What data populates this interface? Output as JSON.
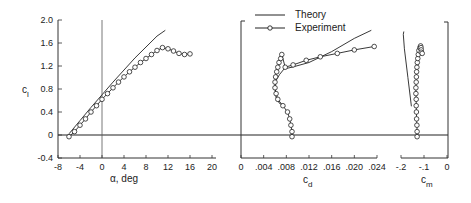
{
  "chart_data": [
    {
      "type": "line",
      "title": "",
      "xlabel": "α, deg",
      "ylabel": "c_l",
      "xlim": [
        -8,
        20
      ],
      "ylim": [
        -0.4,
        2.0
      ],
      "xticks": [
        "-8",
        "-4",
        "0",
        "4",
        "8",
        "12",
        "16",
        "20"
      ],
      "yticks": [
        "-0.4",
        "0",
        "0.4",
        "0.8",
        "1.2",
        "1.6",
        "2.0"
      ],
      "grid": false,
      "series": [
        {
          "name": "Theory",
          "style": "solid line",
          "x": [
            -6,
            -4,
            -2,
            0,
            2,
            4,
            6,
            8,
            10,
            11.5
          ],
          "y": [
            0.02,
            0.25,
            0.48,
            0.7,
            0.92,
            1.13,
            1.34,
            1.53,
            1.72,
            1.82
          ]
        },
        {
          "name": "Experiment",
          "style": "line with open circles",
          "x": [
            -6,
            -5,
            -4,
            -3,
            -2,
            -1,
            0,
            1,
            2,
            3,
            4,
            5,
            6,
            7,
            8,
            9,
            10,
            11,
            12,
            13,
            14,
            15,
            16
          ],
          "y": [
            -0.03,
            0.06,
            0.17,
            0.28,
            0.4,
            0.51,
            0.62,
            0.72,
            0.82,
            0.92,
            1.01,
            1.1,
            1.18,
            1.26,
            1.33,
            1.4,
            1.47,
            1.52,
            1.5,
            1.46,
            1.42,
            1.4,
            1.41
          ]
        }
      ]
    },
    {
      "type": "line",
      "title": "",
      "xlabel": "c_d",
      "ylabel": "",
      "xlim": [
        0,
        0.024
      ],
      "ylim": [
        -0.4,
        2.0
      ],
      "xticks": [
        "0",
        ".004",
        ".008",
        ".012",
        ".016",
        ".020",
        ".024"
      ],
      "grid": false,
      "series": [
        {
          "name": "Theory",
          "style": "solid line",
          "x": [
            0.0078,
            0.0068,
            0.0062,
            0.006,
            0.0062,
            0.0068,
            0.0076,
            0.009,
            0.012,
            0.016,
            0.02,
            0.023
          ],
          "y": [
            0.5,
            0.55,
            0.65,
            0.8,
            0.95,
            1.05,
            1.15,
            1.18,
            1.26,
            1.45,
            1.68,
            1.82
          ]
        },
        {
          "name": "Experiment",
          "style": "line with open circles",
          "x": [
            0.009,
            0.009,
            0.0088,
            0.0086,
            0.0082,
            0.0074,
            0.0065,
            0.0062,
            0.006,
            0.006,
            0.0061,
            0.0063,
            0.0065,
            0.0067,
            0.007,
            0.0072,
            0.0078,
            0.0092,
            0.0115,
            0.014,
            0.017,
            0.02,
            0.0235
          ],
          "y": [
            -0.03,
            0.06,
            0.17,
            0.28,
            0.4,
            0.51,
            0.62,
            0.72,
            0.82,
            0.92,
            1.01,
            1.1,
            1.18,
            1.26,
            1.33,
            1.4,
            1.18,
            1.22,
            1.3,
            1.36,
            1.42,
            1.48,
            1.54
          ]
        }
      ]
    },
    {
      "type": "line",
      "title": "",
      "xlabel": "c_m",
      "ylabel": "",
      "xlim": [
        -0.2,
        0
      ],
      "ylim": [
        -0.4,
        2.0
      ],
      "xticks": [
        "-.2",
        "-.1",
        "0"
      ],
      "grid": false,
      "series": [
        {
          "name": "Theory",
          "style": "solid line",
          "x": [
            -0.155,
            -0.17,
            -0.185,
            -0.19,
            -0.188
          ],
          "y": [
            0.5,
            1.0,
            1.5,
            1.75,
            1.8
          ]
        },
        {
          "name": "Experiment",
          "style": "line with open circles",
          "x": [
            -0.13,
            -0.13,
            -0.131,
            -0.132,
            -0.133,
            -0.134,
            -0.134,
            -0.135,
            -0.135,
            -0.134,
            -0.133,
            -0.132,
            -0.131,
            -0.129,
            -0.127,
            -0.125,
            -0.122,
            -0.118,
            -0.115,
            -0.113,
            -0.112,
            -0.112,
            -0.108
          ],
          "y": [
            -0.03,
            0.06,
            0.17,
            0.28,
            0.4,
            0.51,
            0.62,
            0.72,
            0.82,
            0.92,
            1.01,
            1.1,
            1.18,
            1.26,
            1.33,
            1.4,
            1.47,
            1.52,
            1.55,
            1.52,
            1.48,
            1.44,
            1.42
          ]
        }
      ]
    }
  ],
  "legend": {
    "position": "top-center",
    "entries": [
      {
        "label": "Theory",
        "marker": "line"
      },
      {
        "label": "Experiment",
        "marker": "line-circle"
      }
    ]
  },
  "labels": {
    "cl_axis": "c",
    "cl_sub": "l",
    "alpha_axis": "α, deg",
    "cd_axis": "c",
    "cd_sub": "d",
    "cm_axis": "c",
    "cm_sub": "m"
  }
}
